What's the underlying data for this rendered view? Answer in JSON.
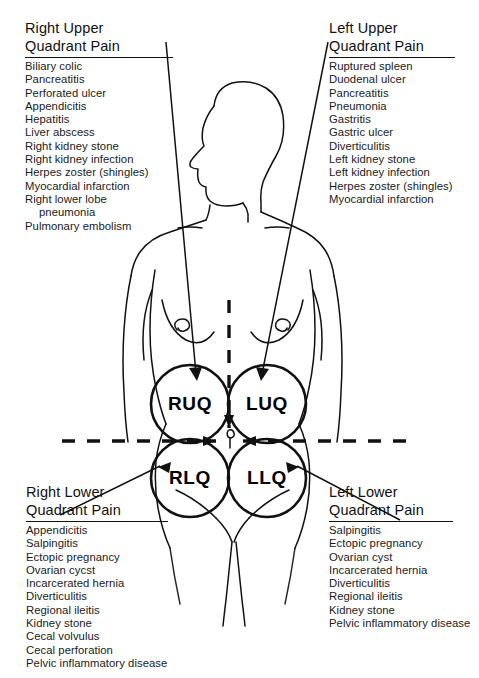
{
  "diagram": {
    "line_color": "#111111",
    "background": "#ffffff"
  },
  "quadrant_markers": [
    {
      "id": "ruq",
      "label": "RUQ",
      "cx": 190,
      "cy": 404
    },
    {
      "id": "luq",
      "label": "LUQ",
      "cx": 267,
      "cy": 404
    },
    {
      "id": "rlq",
      "label": "RLQ",
      "cx": 190,
      "cy": 478
    },
    {
      "id": "llq",
      "label": "LLQ",
      "cx": 267,
      "cy": 478
    }
  ],
  "panels": {
    "right_upper": {
      "title": "Right Upper\nQuadrant Pain",
      "items": [
        "Biliary colic",
        "Pancreatitis",
        "Perforated ulcer",
        "Appendicitis",
        "Hepatitis",
        "Liver abscess",
        "Right kidney stone",
        "Right kidney infection",
        "Herpes zoster (shingles)",
        "Myocardial infarction",
        "Right lower lobe",
        "pneumonia",
        "Pulmonary embolism"
      ],
      "indented_items": [
        "pneumonia"
      ]
    },
    "left_upper": {
      "title": "Left Upper\nQuadrant Pain",
      "items": [
        "Ruptured spleen",
        "Duodenal ulcer",
        "Pancreatitis",
        "Pneumonia",
        "Gastritis",
        "Gastric ulcer",
        "Diverticulitis",
        "Left kidney stone",
        "Left kidney infection",
        "Herpes zoster (shingles)",
        "Myocardial infarction"
      ],
      "indented_items": []
    },
    "right_lower": {
      "title": "Right Lower\nQuadrant Pain",
      "items": [
        "Appendicitis",
        "Salpingitis",
        "Ectopic pregnancy",
        "Ovarian cycst",
        "Incarcerated hernia",
        "Diverticulitis",
        "Regional ileitis",
        "Kidney stone",
        "Cecal volvulus",
        "Cecal perforation",
        "Pelvic inflammatory disease"
      ],
      "indented_items": []
    },
    "left_lower": {
      "title": "Left Lower\nQuadrant Pain",
      "items": [
        "Salpingitis",
        "Ectopic pregnancy",
        "Ovarian cyst",
        "Incarcerated hernia",
        "Diverticulitis",
        "Regional ileitis",
        "Kidney stone",
        "Pelvic inflammatory disease"
      ],
      "indented_items": []
    }
  }
}
